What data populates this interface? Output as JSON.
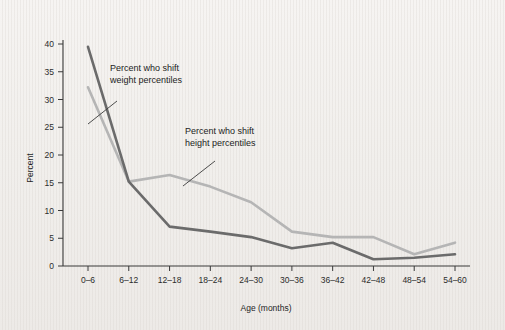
{
  "chart_data": {
    "type": "line",
    "title": "",
    "xlabel": "Age (months)",
    "ylabel": "Percent",
    "categories": [
      "0–6",
      "6–12",
      "12–18",
      "18–24",
      "24–30",
      "30–36",
      "36–42",
      "42–48",
      "48–54",
      "54–60"
    ],
    "ylim": [
      0,
      40
    ],
    "yticks": [
      0,
      5,
      10,
      15,
      20,
      25,
      30,
      35,
      40
    ],
    "ytick_labels": [
      "0",
      "5",
      "10",
      "15",
      "20",
      "25",
      "30",
      "35",
      "40"
    ],
    "grid": false,
    "legend": "annotations",
    "series": [
      {
        "name": "Percent who shift weight percentiles",
        "color": "#6b6b6b",
        "values": [
          39.5,
          15.2,
          7.1,
          6.2,
          5.2,
          3.2,
          4.2,
          1.2,
          1.5,
          2.1
        ]
      },
      {
        "name": "Percent who shift height percentiles",
        "color": "#b5b5b5",
        "values": [
          32.2,
          15.2,
          16.4,
          14.3,
          11.5,
          6.2,
          5.2,
          5.2,
          2.1,
          4.2
        ]
      }
    ],
    "annotations": [
      {
        "id": "weight-annotation",
        "line1": "Percent who shift",
        "line2": "weight percentiles"
      },
      {
        "id": "height-annotation",
        "line1": "Percent who shift",
        "line2": "height percentiles"
      }
    ]
  },
  "colors": {
    "background": "#f2f0ee",
    "axis": "#3a3a3a",
    "text": "#1f1f1f",
    "weight_line": "#6b6b6b",
    "height_line": "#b5b5b5"
  }
}
